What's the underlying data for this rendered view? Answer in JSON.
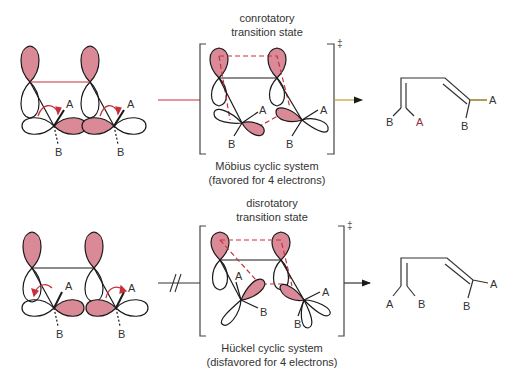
{
  "colors": {
    "lobe_fill": "#d98a96",
    "outline": "#1a1a1a",
    "accent_line": "#c8303c",
    "arrow_gold": "#c89a30",
    "text": "#333333"
  },
  "top_row": {
    "ts_title_line1": "conrotatory",
    "ts_title_line2": "transition state",
    "system_line1": "Möbius cyclic system",
    "system_line2": "(favored for 4 electrons)",
    "ts_symbol": "‡",
    "reactant_labels": {
      "a1": "A",
      "b1": "B",
      "a2": "A",
      "b2": "B"
    },
    "ts_labels": {
      "a1": "A",
      "b1": "B",
      "a2": "A",
      "b2": "B"
    },
    "product_labels": {
      "b1": "B",
      "a1": "A",
      "b2": "B",
      "a2": "A"
    },
    "arrow_status": "allowed"
  },
  "bottom_row": {
    "ts_title_line1": "disrotatory",
    "ts_title_line2": "transition state",
    "system_line1": "Hückel cyclic system",
    "system_line2": "(disfavored for 4 electrons)",
    "ts_symbol": "‡",
    "reactant_labels": {
      "a1": "A",
      "b1": "B",
      "a2": "A",
      "b2": "B"
    },
    "ts_labels": {
      "a1": "A",
      "b1": "B",
      "a2": "A",
      "b2": "B"
    },
    "product_labels": {
      "a1": "A",
      "b1": "B",
      "b2": "B",
      "a2": "A"
    },
    "arrow_status": "forbidden"
  }
}
